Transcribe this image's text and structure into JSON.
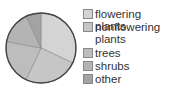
{
  "chart_data": {
    "type": "pie",
    "title": "",
    "categories": [
      "flowering plants",
      "nonflowering plants",
      "trees",
      "shrubs",
      "other"
    ],
    "values": [
      32,
      25,
      21,
      15,
      7
    ],
    "colors": [
      "#d4d4d4",
      "#c6c6c6",
      "#bdbdbd",
      "#b4b4b4",
      "#a3a3a3"
    ],
    "start_angle": "12 o'clock",
    "direction": "clockwise",
    "legend_position": "right"
  },
  "legend": {
    "items": [
      {
        "label": "flowering plants"
      },
      {
        "label": "nonflowering plants"
      },
      {
        "label": "trees"
      },
      {
        "label": "shrubs"
      },
      {
        "label": "other"
      }
    ]
  }
}
